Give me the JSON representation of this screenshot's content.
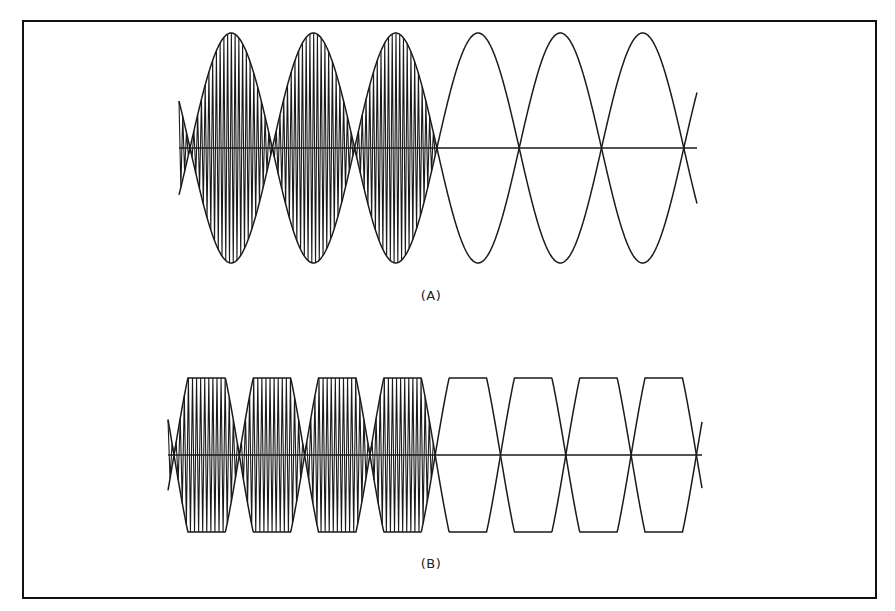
{
  "figure": {
    "panels": [
      {
        "id": "A",
        "label": "(A)",
        "description": "Sinusoidal envelope; first three lobes filled with dense carrier oscillation, last three lobes outline only",
        "envelope": "sine",
        "axis_y": 148,
        "amplitude_px": 115,
        "x_start": 179,
        "x_end": 697,
        "first_zero": 190,
        "zero_spacing": 82.3,
        "lobes": 6,
        "filled_lobes": 3,
        "carrier_lines_per_lobe": 22
      },
      {
        "id": "B",
        "label": "(B)",
        "description": "Clipped (trapezoidal) envelope; first four lobes filled with dense carrier oscillation, last four lobes outline only",
        "envelope": "clipped-sine",
        "axis_y": 455,
        "amplitude_px": 77,
        "clip_ratio": 0.62,
        "x_start": 168,
        "x_end": 702,
        "first_zero": 174,
        "zero_spacing": 65.3,
        "lobes": 8,
        "filled_lobes": 4,
        "carrier_lines_per_lobe": 16
      }
    ],
    "colors": {
      "line": "#1a1a1a",
      "background": "#ffffff",
      "border": "#111111"
    }
  }
}
